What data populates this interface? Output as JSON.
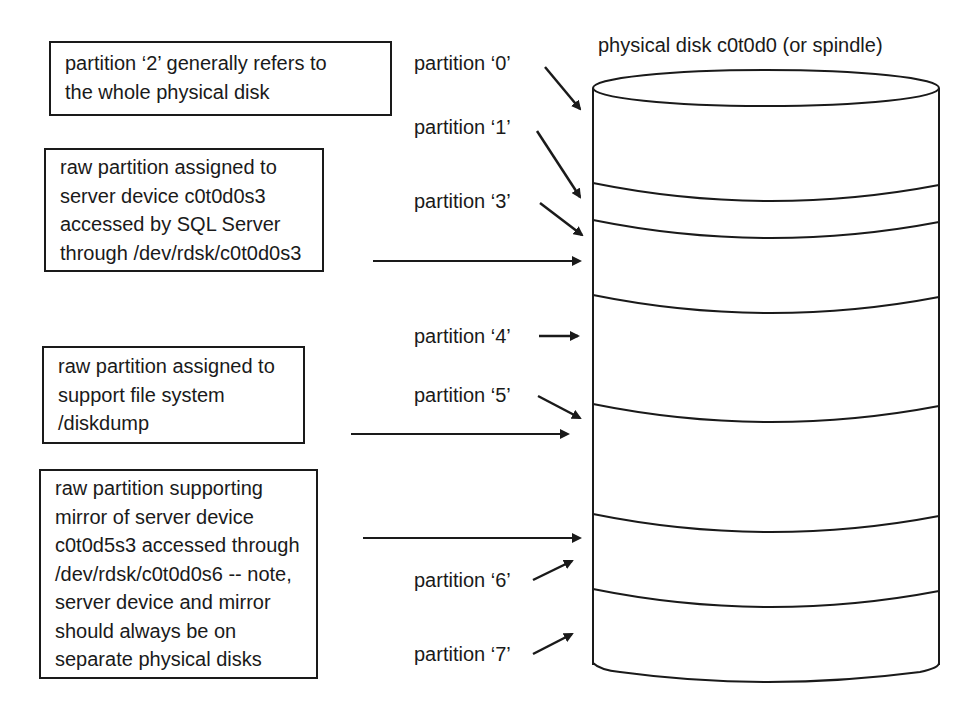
{
  "disk": {
    "title": "physical disk c0t0d0 (or spindle)",
    "stroke_color": "#1a1a1a"
  },
  "partitions": [
    {
      "id": "0",
      "label": "partition ‘0’"
    },
    {
      "id": "1",
      "label": "partition ‘1’"
    },
    {
      "id": "3",
      "label": "partition ‘3’"
    },
    {
      "id": "4",
      "label": "partition ‘4’"
    },
    {
      "id": "5",
      "label": "partition ‘5’"
    },
    {
      "id": "6",
      "label": "partition ‘6’"
    },
    {
      "id": "7",
      "label": "partition ‘7’"
    }
  ],
  "notes": [
    {
      "id": "whole-disk",
      "lines": [
        "partition ‘2’ generally refers to",
        "the whole physical disk"
      ]
    },
    {
      "id": "server-device",
      "lines": [
        "raw partition assigned to",
        "server device c0t0d0s3",
        "accessed by SQL Server",
        "through /dev/rdsk/c0t0d0s3"
      ]
    },
    {
      "id": "file-system",
      "lines": [
        "raw partition assigned to",
        "support file system",
        "/diskdump"
      ]
    },
    {
      "id": "mirror",
      "lines": [
        "raw partition supporting",
        "mirror of server device",
        "c0t0d5s3 accessed through",
        "/dev/rdsk/c0t0d0s6 -- note,",
        "server device and mirror",
        "should always be on",
        "separate physical disks"
      ]
    }
  ]
}
